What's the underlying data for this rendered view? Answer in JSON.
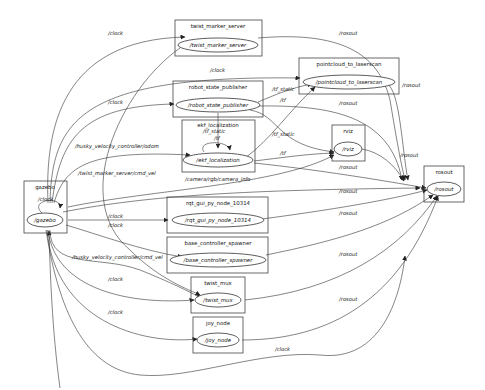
{
  "graph": {
    "title": "rqt_graph",
    "nodes": [
      {
        "id": "twist_marker_server",
        "cluster_label": "twist_marker_server",
        "node_label": "/twist_marker_server"
      },
      {
        "id": "pointcloud_to_laserscan",
        "cluster_label": "pointcloud_to_laserscan",
        "node_label": "/pointcloud_to_laserscan"
      },
      {
        "id": "robot_state_publisher",
        "cluster_label": "robot_state_publisher",
        "node_label": "/robot_state_publisher"
      },
      {
        "id": "ekf_localization",
        "cluster_label": "ekf_localization",
        "node_label": "/ekf_localization",
        "self_loop_label_1": "/tf_static",
        "self_loop_label_2": "/tf"
      },
      {
        "id": "rviz",
        "cluster_label": "rviz",
        "node_label": "/rviz"
      },
      {
        "id": "gazebo",
        "cluster_label": "gazebo",
        "node_label": "/gazebo",
        "self_loop_label": "/clock"
      },
      {
        "id": "rosout",
        "cluster_label": "rosout",
        "node_label": "/rosout"
      },
      {
        "id": "rqt_gui_py_node_10314",
        "cluster_label": "rqt_gui_py_node_10314",
        "node_label": "/rqt_gui_py_node_10314"
      },
      {
        "id": "base_controller_spawner",
        "cluster_label": "base_controller_spawner",
        "node_label": "/base_controller_spawner"
      },
      {
        "id": "twist_mux",
        "cluster_label": "twist_mux",
        "node_label": "/twist_mux"
      },
      {
        "id": "joy_node",
        "cluster_label": "joy_node",
        "node_label": "/joy_node"
      }
    ],
    "edge_labels": {
      "clock_twist_marker": "/clock",
      "clock_pointcloud": "/clock",
      "clock_robot_state": "/clock",
      "odom": "/husky_velocity_controller/odom",
      "twist_marker_cmd_vel": "/twist_marker_server/cmd_vel",
      "clock_rqt": "/clock",
      "clock_base": "/clock",
      "husky_cmd_vel": "/husky_velocity_controller/cmd_vel",
      "clock_twist_mux": "/clock",
      "clock_joy": "/clock",
      "clock_rosout_bottom": "/clock",
      "tf_static_pc": "/tf_static",
      "tf_pc": "/tf",
      "tf_static_rviz": "/tf_static",
      "tf_rviz": "/tf",
      "camera_info": "/camera/rgb/camera_info",
      "rosout_twist_marker": "/rosout",
      "rosout_pointcloud": "/rosout",
      "rosout_robot_state": "/rosout",
      "rosout_rviz": "/rosout",
      "rosout_ekf": "/rosout",
      "rosout_rqt": "/rosout",
      "rosout_base": "/rosout",
      "rosout_twist_mux": "/rosout",
      "rosout_joy": "/rosout"
    },
    "colors": {
      "background": "#ffffff",
      "stroke": "#333333",
      "text": "#111111"
    }
  }
}
